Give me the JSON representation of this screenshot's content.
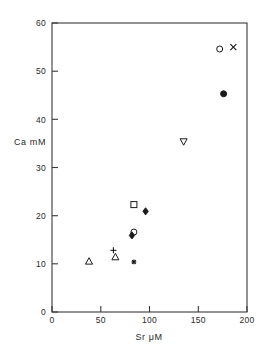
{
  "chart_data": {
    "type": "scatter",
    "title": "",
    "xlabel": "Sr μM",
    "ylabel": "Ca mM",
    "xlim": [
      0,
      200
    ],
    "ylim": [
      0,
      60
    ],
    "xticks": [
      0,
      50,
      100,
      150,
      200
    ],
    "yticks": [
      0,
      10,
      20,
      30,
      40,
      50,
      60
    ],
    "xtick_labels": [
      "0",
      "50",
      "100",
      "150",
      "200"
    ],
    "ytick_labels": [
      "0",
      "10",
      "20",
      "30",
      "40",
      "50",
      "60"
    ],
    "grid": false,
    "legend": false,
    "frame": "full-box",
    "points": [
      {
        "label": "open-triangle-up-low",
        "marker": "triangle-up-open",
        "x": 38,
        "y": 10.5
      },
      {
        "label": "plus-mid-left",
        "marker": "plus",
        "x": 63,
        "y": 12.8
      },
      {
        "label": "open-triangle-up-mid",
        "marker": "triangle-up-open",
        "x": 65,
        "y": 11.4
      },
      {
        "label": "star-low",
        "marker": "star",
        "x": 84,
        "y": 10.4
      },
      {
        "label": "open-circle-cluster",
        "marker": "circle-open",
        "x": 84,
        "y": 16.6
      },
      {
        "label": "filled-diamond-cluster",
        "marker": "diamond-filled",
        "x": 82,
        "y": 15.9
      },
      {
        "label": "open-square-mid",
        "marker": "square-open",
        "x": 84,
        "y": 22.3
      },
      {
        "label": "filled-diamond-mid",
        "marker": "diamond-filled",
        "x": 96,
        "y": 20.9
      },
      {
        "label": "open-triangle-down",
        "marker": "triangle-down-open",
        "x": 135,
        "y": 35.4
      },
      {
        "label": "open-circle-high",
        "marker": "circle-open",
        "x": 172,
        "y": 54.6
      },
      {
        "label": "cross-high",
        "marker": "x-cross",
        "x": 186,
        "y": 55.0
      },
      {
        "label": "filled-circle-high",
        "marker": "circle-filled",
        "x": 176,
        "y": 45.3
      }
    ]
  },
  "axes": {
    "x_title": "Sr μM",
    "y_title": "Ca mM"
  },
  "colors": {
    "frame": "#3a3a3a",
    "marker": "#1a1a1a",
    "background": "#ffffff"
  }
}
